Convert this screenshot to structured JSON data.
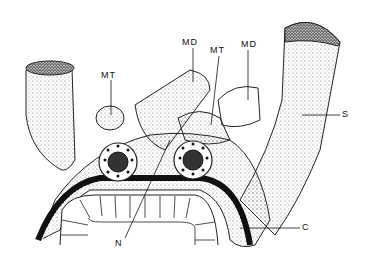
{
  "figure": {
    "labels": {
      "mt_left": "MT",
      "md_center": "MD",
      "mt_center": "MT",
      "md_right": "MD",
      "s": "S",
      "n": "N",
      "c": "C"
    }
  }
}
